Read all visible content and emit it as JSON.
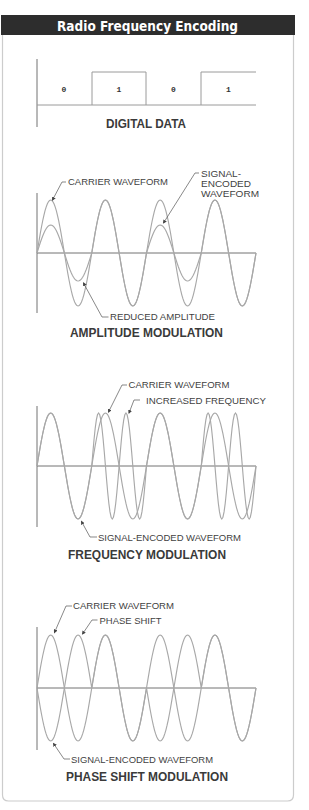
{
  "header": {
    "title": "Radio Frequency Encoding"
  },
  "digital_data": {
    "bits": [
      "0",
      "1",
      "0",
      "1"
    ],
    "caption": "DIGITAL DATA"
  },
  "amplitude_modulation": {
    "caption": "AMPLITUDE MODULATION",
    "labels": {
      "carrier": "CARRIER WAVEFORM",
      "signal_line1": "SIGNAL-",
      "signal_line2": "ENCODED",
      "signal_line3": "WAVEFORM",
      "reduced": "REDUCED AMPLITUDE"
    }
  },
  "frequency_modulation": {
    "caption": "FREQUENCY MODULATION",
    "labels": {
      "carrier": "CARRIER WAVEFORM",
      "increased": "INCREASED FREQUENCY",
      "signal": "SIGNAL-ENCODED WAVEFORM"
    }
  },
  "phase_shift_modulation": {
    "caption": "PHASE SHIFT MODULATION",
    "labels": {
      "carrier": "CARRIER WAVEFORM",
      "shift": "PHASE SHIFT",
      "signal": "SIGNAL-ENCODED WAVEFORM"
    }
  },
  "waveforms": {
    "x0": 37,
    "bit_width": 54.75,
    "am": {
      "axis_y": 253,
      "carrier_amp": 53,
      "amp_by_bit": {
        "0": 28,
        "1": 53
      }
    },
    "fm": {
      "axis_y": 466,
      "carrier_amp": 53,
      "cycles_by_bit": {
        "0": 1,
        "1": 2
      }
    },
    "psk": {
      "axis_y": 688,
      "carrier_amp": 53,
      "phase_deg_by_bit": {
        "0": 180,
        "1": 0
      }
    }
  },
  "colors": {
    "title_bar": "#2d2d2d",
    "card_border": "#cccccc",
    "waveform": "#a8a8a8",
    "axis": "#727272",
    "text": "#3f3f3f"
  }
}
